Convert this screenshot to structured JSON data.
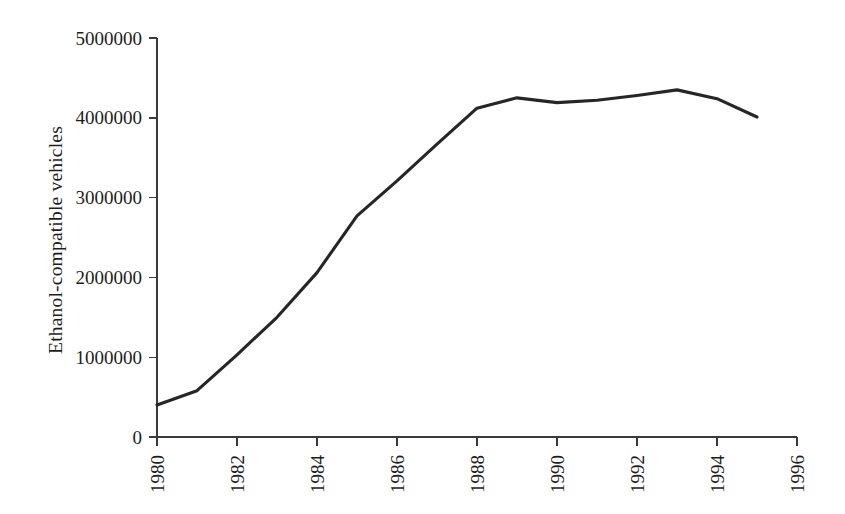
{
  "chart_data": {
    "type": "line",
    "title": "",
    "xlabel": "",
    "ylabel": "Ethanol-compatible vehicles",
    "x": [
      1980,
      1981,
      1982,
      1983,
      1984,
      1985,
      1986,
      1987,
      1988,
      1989,
      1990,
      1991,
      1992,
      1993,
      1994,
      1995
    ],
    "values": [
      400000,
      580000,
      1030000,
      1500000,
      2060000,
      2770000,
      3210000,
      3670000,
      4120000,
      4250000,
      4190000,
      4220000,
      4280000,
      4350000,
      4240000,
      4010000
    ],
    "series": [
      {
        "name": "Ethanol-compatible vehicles",
        "values": [
          400000,
          580000,
          1030000,
          1500000,
          2060000,
          2770000,
          3210000,
          3670000,
          4120000,
          4250000,
          4190000,
          4220000,
          4280000,
          4350000,
          4240000,
          4010000
        ],
        "color": "#262626"
      }
    ],
    "xlim": [
      1980,
      1996
    ],
    "ylim": [
      0,
      5000000
    ],
    "xticks": [
      1980,
      1982,
      1984,
      1986,
      1988,
      1990,
      1992,
      1994,
      1996
    ],
    "xtick_labels": [
      "1980",
      "1982",
      "1984",
      "1986",
      "1988",
      "1990",
      "1992",
      "1994",
      "1996"
    ],
    "xtick_rotation": 90,
    "yticks": [
      0,
      1000000,
      2000000,
      3000000,
      4000000,
      5000000
    ],
    "ytick_labels": [
      "0",
      "1000000",
      "2000000",
      "3000000",
      "4000000",
      "5000000"
    ],
    "grid": false,
    "legend": false,
    "line_color": "#262626",
    "axis_color": "#3a3a3a",
    "background_color": "#ffffff"
  }
}
